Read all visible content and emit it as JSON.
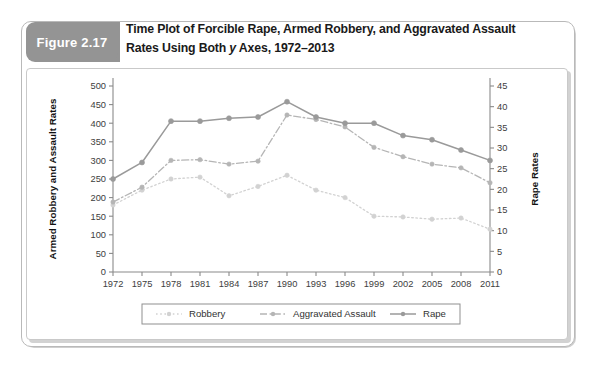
{
  "figure": {
    "badge_label": "Figure 2.17",
    "title_line1": "Time Plot of Forcible Rape, Armed Robbery, and Aggravated Assault",
    "title_line2_pre": "Rates Using Both ",
    "title_line2_italic": "y",
    "title_line2_post": " Axes, 1972–2013"
  },
  "colors": {
    "badge_bg": "#949494",
    "frame": "#b9b9b9",
    "axis": "#8a8a8a",
    "robbery": "#d2d2d2",
    "aggravated_assault": "#b5b5b5",
    "rape": "#9a9a9a"
  },
  "chart_data": {
    "type": "line",
    "title": "Time Plot of Forcible Rape, Armed Robbery, and Aggravated Assault Rates Using Both y Axes, 1972–2013",
    "xlabel": "",
    "ylabel": "Armed Robbery and Assault Rates",
    "y2label": "Rape Rates",
    "grid": false,
    "legend_position": "bottom",
    "x": [
      1972,
      1975,
      1978,
      1981,
      1984,
      1987,
      1990,
      1993,
      1996,
      1999,
      2002,
      2005,
      2008,
      2011
    ],
    "xticklabels": [
      "1972",
      "1975",
      "1978",
      "1981",
      "1984",
      "1987",
      "1990",
      "1993",
      "1996",
      "1999",
      "2002",
      "2005",
      "2008",
      "2011"
    ],
    "ylim": [
      0,
      500
    ],
    "yticks": [
      0,
      50,
      100,
      150,
      200,
      250,
      300,
      350,
      400,
      450,
      500
    ],
    "yticklabels": [
      "0",
      "50",
      "100",
      "150",
      "200",
      "250",
      "300",
      "350",
      "400",
      "450",
      "500"
    ],
    "y2lim": [
      0,
      45
    ],
    "y2ticks": [
      0,
      5,
      10,
      15,
      20,
      25,
      30,
      35,
      40,
      45
    ],
    "y2ticklabels": [
      "0",
      "5",
      "10",
      "15",
      "20",
      "25",
      "30",
      "35",
      "40",
      "45"
    ],
    "series": [
      {
        "name": "Robbery",
        "axis": "left",
        "linestyle": "dotted",
        "color": "#d2d2d2",
        "values": [
          180,
          220,
          250,
          255,
          205,
          230,
          260,
          220,
          200,
          150,
          148,
          142,
          145,
          115
        ]
      },
      {
        "name": "Aggravated Assault",
        "axis": "left",
        "linestyle": "dashdot",
        "color": "#b5b5b5",
        "values": [
          188,
          228,
          300,
          302,
          290,
          298,
          422,
          410,
          390,
          335,
          310,
          290,
          280,
          240
        ]
      },
      {
        "name": "Rape",
        "axis": "right",
        "linestyle": "solid",
        "color": "#9a9a9a",
        "values": [
          22.5,
          26.5,
          36.5,
          36.5,
          37.2,
          37.5,
          41.2,
          37.5,
          36.0,
          36.0,
          33.0,
          32.0,
          29.5,
          27.0
        ]
      }
    ],
    "legend": [
      "Robbery",
      "Aggravated Assault",
      "Rape"
    ]
  }
}
